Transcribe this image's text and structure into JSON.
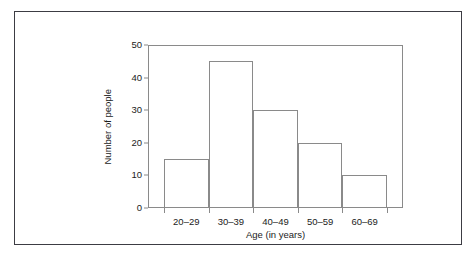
{
  "chart_data": {
    "type": "bar",
    "title": "",
    "subtitle": "",
    "xlabel": "Age (in years)",
    "ylabel": "Number of people",
    "categories": [
      "20–29",
      "30–39",
      "40–49",
      "50–59",
      "60–69"
    ],
    "values": [
      15,
      45,
      30,
      20,
      10
    ],
    "series": [
      {
        "name": "Number of people",
        "values": [
          15,
          45,
          30,
          20,
          10
        ]
      }
    ],
    "ylim": [
      0,
      50
    ],
    "ytick_labels": [
      "0",
      "10",
      "20",
      "30",
      "40",
      "50"
    ],
    "ytick_values": [
      0,
      10,
      20,
      30,
      40,
      50
    ],
    "grid": false,
    "legend": false,
    "legend_position": "none",
    "style": {
      "bar_fill": "#ffffff",
      "bar_stroke": "#8a8a8a",
      "axis_color": "#8a8a8a",
      "text_color": "#1b1b1b",
      "figure_border": "#3c3c43",
      "background": "#ffffff"
    }
  }
}
